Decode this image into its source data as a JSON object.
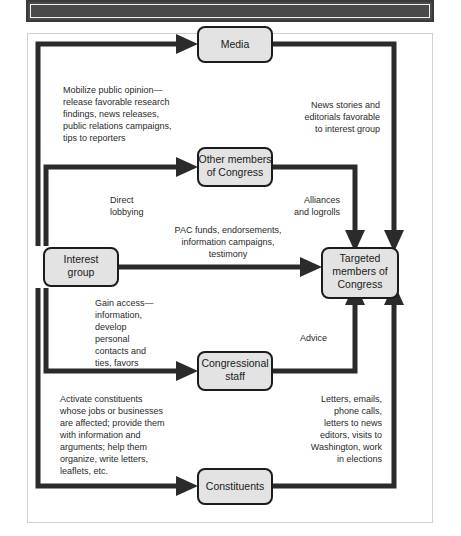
{
  "figure": {
    "header_bar": {
      "label": ""
    },
    "title": ""
  },
  "nodes": {
    "media": {
      "label_line1": "Media",
      "label_line2": ""
    },
    "other_members": {
      "label_line1": "Other members",
      "label_line2": "of Congress"
    },
    "interest_group": {
      "label_line1": "Interest",
      "label_line2": "group"
    },
    "targeted": {
      "label_line1": "Targeted",
      "label_line2": "members of",
      "label_line3": "Congress"
    },
    "congressional_staff": {
      "label_line1": "Congressional",
      "label_line2": "staff"
    },
    "constituents": {
      "label_line1": "Constituents",
      "label_line2": ""
    }
  },
  "annotations": {
    "mobilize": {
      "align": "left",
      "lines": [
        "Mobilize public opinion—",
        "release favorable research",
        "findings, news releases,",
        "public relations campaigns,",
        "tips to reporters"
      ]
    },
    "news_stories": {
      "align": "right",
      "lines": [
        "News stories and",
        "editorials favorable",
        "to interest group"
      ]
    },
    "direct_lobbying": {
      "align": "left",
      "lines": [
        "Direct",
        "lobbying"
      ]
    },
    "alliances": {
      "align": "right",
      "lines": [
        "Alliances",
        "and logrolls"
      ]
    },
    "pac_funds": {
      "align": "middle",
      "lines": [
        "PAC funds, endorsements,",
        "information campaigns,",
        "testimony"
      ]
    },
    "gain_access": {
      "align": "left",
      "lines": [
        "Gain access—",
        "information,",
        "develop",
        "personal",
        "contacts and",
        "ties, favors"
      ]
    },
    "advice": {
      "align": "left",
      "lines": [
        "Advice"
      ]
    },
    "activate": {
      "align": "left",
      "lines": [
        "Activate constituents",
        "whose jobs or businesses",
        "are affected; provide them",
        "with information and",
        "arguments; help them",
        "organize, write letters,",
        "leaflets, etc."
      ]
    },
    "letters": {
      "align": "right",
      "lines": [
        "Letters, emails,",
        "phone calls,",
        "letters to news",
        "editors, visits to",
        "Washington, work",
        "in elections"
      ]
    }
  },
  "colors": {
    "box_fill": "#e3e3e3",
    "box_stroke": "#1c1c1c",
    "flow_line": "#2b2b2b",
    "header_bar": "#4a4a4a",
    "frame_border": "#cfcfcf",
    "text": "#1a1a1a"
  }
}
